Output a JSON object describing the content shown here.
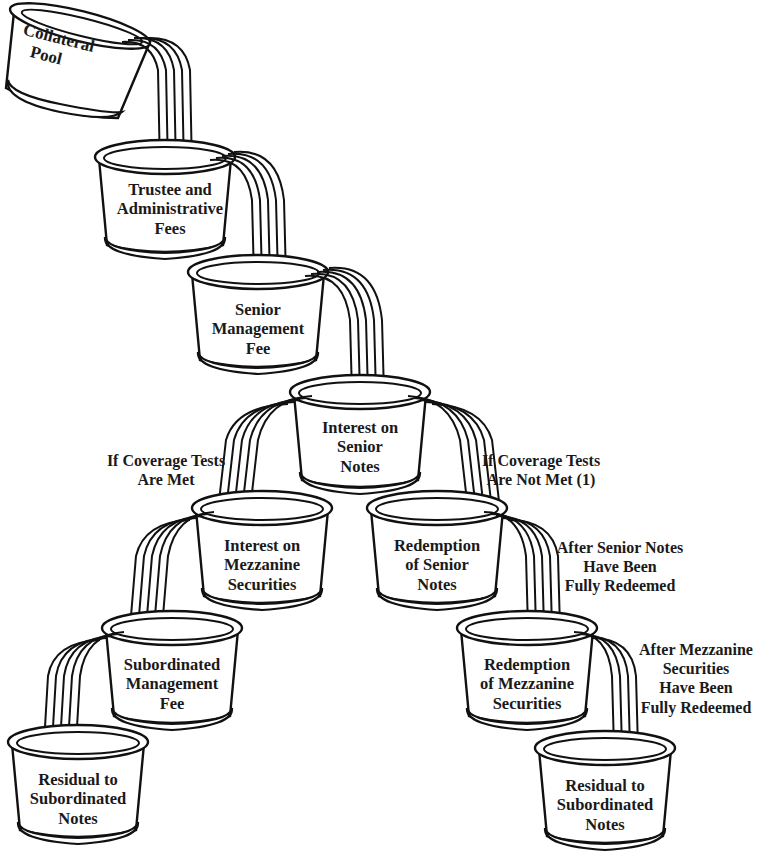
{
  "diagram": {
    "title": "",
    "style": {
      "ink_color": "#111111",
      "background": "#ffffff"
    },
    "buckets": [
      {
        "id": "collateral-pool",
        "lines": [
          "Collateral",
          "Pool"
        ]
      },
      {
        "id": "trustee-admin-fees",
        "lines": [
          "Trustee and",
          "Administrative",
          "Fees"
        ]
      },
      {
        "id": "senior-management-fee",
        "lines": [
          "Senior",
          "Management",
          "Fee"
        ]
      },
      {
        "id": "interest-senior-notes",
        "lines": [
          "Interest on",
          "Senior",
          "Notes"
        ]
      },
      {
        "id": "interest-mezzanine",
        "lines": [
          "Interest on",
          "Mezzanine",
          "Securities"
        ]
      },
      {
        "id": "redemption-senior-notes",
        "lines": [
          "Redemption",
          "of Senior",
          "Notes"
        ]
      },
      {
        "id": "subordinated-management-fee",
        "lines": [
          "Subordinated",
          "Management",
          "Fee"
        ]
      },
      {
        "id": "redemption-mezzanine",
        "lines": [
          "Redemption",
          "of Mezzanine",
          "Securities"
        ]
      },
      {
        "id": "residual-left",
        "lines": [
          "Residual to",
          "Subordinated",
          "Notes"
        ]
      },
      {
        "id": "residual-right",
        "lines": [
          "Residual to",
          "Subordinated",
          "Notes"
        ]
      }
    ],
    "conditions": [
      {
        "id": "coverage-met",
        "lines": [
          "If Coverage Tests",
          "Are Met"
        ]
      },
      {
        "id": "coverage-not-met",
        "lines": [
          "If Coverage Tests",
          "Are Not Met (1)"
        ]
      },
      {
        "id": "after-senior-redeemed",
        "lines": [
          "After Senior Notes",
          "Have Been",
          "Fully Redeemed"
        ]
      },
      {
        "id": "after-mezzanine-redeemed",
        "lines": [
          "After Mezzanine",
          "Securities",
          "Have Been",
          "Fully Redeemed"
        ]
      }
    ],
    "flows": [
      {
        "from": "collateral-pool",
        "to": "trustee-admin-fees"
      },
      {
        "from": "trustee-admin-fees",
        "to": "senior-management-fee"
      },
      {
        "from": "senior-management-fee",
        "to": "interest-senior-notes"
      },
      {
        "from": "interest-senior-notes",
        "to": "interest-mezzanine",
        "condition": "coverage-met"
      },
      {
        "from": "interest-senior-notes",
        "to": "redemption-senior-notes",
        "condition": "coverage-not-met"
      },
      {
        "from": "interest-mezzanine",
        "to": "subordinated-management-fee"
      },
      {
        "from": "subordinated-management-fee",
        "to": "residual-left"
      },
      {
        "from": "redemption-senior-notes",
        "to": "redemption-mezzanine",
        "condition": "after-senior-redeemed"
      },
      {
        "from": "redemption-mezzanine",
        "to": "residual-right",
        "condition": "after-mezzanine-redeemed"
      }
    ]
  }
}
